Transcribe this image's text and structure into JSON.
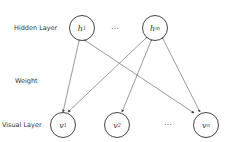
{
  "labels": {
    "hidden": "Hidden Layer",
    "weight": "Weight",
    "visual": "Visual Layer"
  },
  "hidden_nodes": [
    {
      "base": "h",
      "sub": "1"
    },
    {
      "base": "h",
      "sub": "m"
    }
  ],
  "visual_nodes": [
    {
      "base": "v",
      "sub": "1"
    },
    {
      "base": "v",
      "sub": "2"
    },
    {
      "base": "v",
      "sub": "n"
    }
  ],
  "ellipsis": "…",
  "edges": [
    [
      "h1",
      "v1"
    ],
    [
      "h1",
      "vn"
    ],
    [
      "hm",
      "v1"
    ],
    [
      "hm",
      "v2"
    ],
    [
      "hm",
      "vn"
    ]
  ]
}
